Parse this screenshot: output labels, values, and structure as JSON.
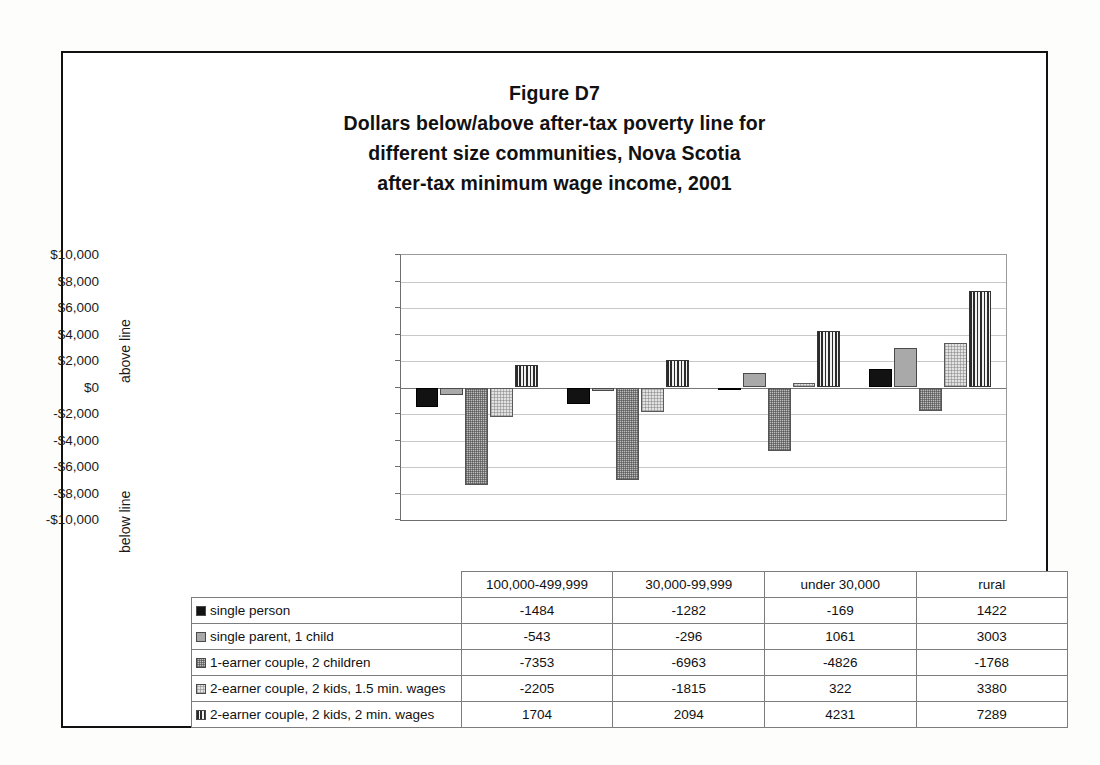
{
  "figure": {
    "title_lines": [
      "Figure D7",
      "Dollars below/above after-tax poverty line for",
      "different size communities, Nova Scotia",
      "after-tax minimum wage income, 2001"
    ],
    "above_line_label": "above line",
    "below_line_label": "below line"
  },
  "chart_data": {
    "type": "bar",
    "xlabel": "",
    "ylabel": "",
    "ylim": [
      -10000,
      10000
    ],
    "ytick_step": 2000,
    "grid": true,
    "legend_position": "table-below",
    "categories": [
      "100,000-499,999",
      "30,000-99,999",
      "under 30,000",
      "rural"
    ],
    "ytick_labels": [
      "$10,000",
      "$8,000",
      "$6,000",
      "$4,000",
      "$2,000",
      "$0",
      "-$2,000",
      "-$4,000",
      "-$6,000",
      "-$8,000",
      "-$10,000"
    ],
    "ytick_values": [
      10000,
      8000,
      6000,
      4000,
      2000,
      0,
      -2000,
      -4000,
      -6000,
      -8000,
      -10000
    ],
    "series": [
      {
        "name": "single person",
        "pattern": "solid-black",
        "values": [
          -1484,
          -1282,
          -169,
          1422
        ]
      },
      {
        "name": "single parent, 1 child",
        "pattern": "solid-gray",
        "values": [
          -543,
          -296,
          1061,
          3003
        ]
      },
      {
        "name": "1-earner couple, 2 children",
        "pattern": "stipple-gray",
        "values": [
          -7353,
          -6963,
          -4826,
          -1768
        ]
      },
      {
        "name": "2-earner couple, 2 kids, 1.5 min. wages",
        "pattern": "stipple-light",
        "values": [
          -2205,
          -1815,
          322,
          3380
        ]
      },
      {
        "name": "2-earner couple, 2 kids, 2 min. wages",
        "pattern": "vertical-stripe",
        "values": [
          1704,
          2094,
          4231,
          7289
        ]
      }
    ]
  },
  "table": {
    "corner": "",
    "column_headers": [
      "100,000-499,999",
      "30,000-99,999",
      "under 30,000",
      "rural"
    ],
    "rows": [
      {
        "label": "single person",
        "swatch": "solid-black",
        "values": [
          "-1484",
          "-1282",
          "-169",
          "1422"
        ]
      },
      {
        "label": "single parent, 1 child",
        "swatch": "solid-gray",
        "values": [
          "-543",
          "-296",
          "1061",
          "3003"
        ]
      },
      {
        "label": "1-earner couple, 2 children",
        "swatch": "stipple-gray",
        "values": [
          "-7353",
          "-6963",
          "-4826",
          "-1768"
        ]
      },
      {
        "label": "2-earner couple, 2 kids, 1.5 min. wages",
        "swatch": "stipple-light",
        "values": [
          "-2205",
          "-1815",
          "322",
          "3380"
        ]
      },
      {
        "label": "2-earner couple, 2 kids, 2 min. wages",
        "swatch": "vertical-stripe",
        "values": [
          "1704",
          "2094",
          "4231",
          "7289"
        ]
      }
    ]
  },
  "colors": {
    "frame": "#111111",
    "gridline": "#c8c8c8",
    "axis": "#6e6e6e",
    "series_black": "#121212",
    "series_gray": "#a9a9a9",
    "series_stipple": "#bdbdbd",
    "series_light": "#e2e2e2",
    "series_stripe": "#2b2b2b"
  }
}
